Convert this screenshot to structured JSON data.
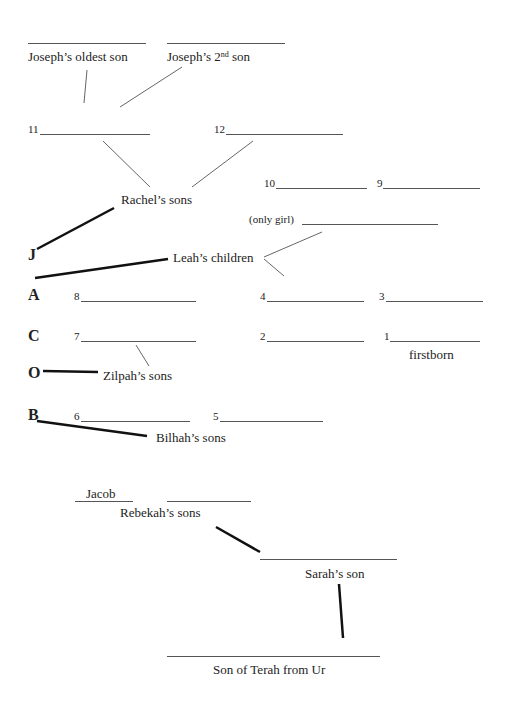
{
  "worksheet": {
    "joseph": {
      "oldest_son_label": "Joseph’s oldest son",
      "second_son_label_prefix": "Joseph’s 2",
      "second_son_label_sup": "nd",
      "second_son_label_suffix": " son"
    },
    "rachel": {
      "label": "Rachel’s sons",
      "sons": [
        {
          "number": "11",
          "value": ""
        },
        {
          "number": "12",
          "value": ""
        }
      ]
    },
    "leah": {
      "label": "Leah’s children",
      "only_girl_label": "(only girl)",
      "children": [
        {
          "number": "10",
          "value": ""
        },
        {
          "number": "9",
          "value": ""
        },
        {
          "number": "4",
          "value": ""
        },
        {
          "number": "3",
          "value": ""
        },
        {
          "number": "2",
          "value": ""
        },
        {
          "number": "1",
          "value": ""
        }
      ],
      "firstborn_label": "firstborn"
    },
    "zilpah": {
      "label": "Zilpah’s sons",
      "sons": [
        {
          "number": "8",
          "value": ""
        },
        {
          "number": "7",
          "value": ""
        }
      ]
    },
    "bilhah": {
      "label": "Bilhah’s sons",
      "sons": [
        {
          "number": "6",
          "value": ""
        },
        {
          "number": "5",
          "value": ""
        }
      ]
    },
    "jacob_letters": [
      "J",
      "A",
      "C",
      "O",
      "B"
    ],
    "rebekah": {
      "label": "Rebekah’s sons",
      "sons": [
        {
          "value": "Jacob"
        },
        {
          "value": ""
        }
      ]
    },
    "sarah": {
      "label": "Sarah’s son",
      "value": ""
    },
    "terah": {
      "label": "Son of Terah from Ur",
      "value": ""
    }
  }
}
